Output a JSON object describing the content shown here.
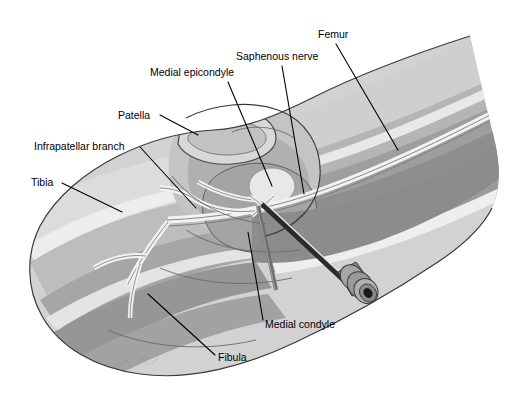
{
  "figure": {
    "background_color": "#ffffff",
    "width": 516,
    "height": 404
  },
  "palette": {
    "background": "#ffffff",
    "skin_lightest": "#e2e2e2",
    "skin_light": "#d2d2d2",
    "skin_mid": "#bdbdbd",
    "muscle_mid": "#a9a9a9",
    "muscle_dark": "#949494",
    "muscle_darkest": "#808080",
    "bone_highlight": "#eaeaea",
    "nerve_light": "#efefef",
    "outline": "#3a3a3a",
    "needle_dark": "#2b2b2b",
    "hub_gray": "#9a9a9a",
    "hub_dark": "#4a4a4a",
    "label_text": "#000000",
    "leader_line": "#000000"
  },
  "labels": [
    {
      "id": "femur",
      "text": "Femur",
      "text_x": 318,
      "text_y": 38,
      "leader": "M 336 44 L 398 150",
      "anchor": "start"
    },
    {
      "id": "saphenous-nerve",
      "text": "Saphenous nerve",
      "text_x": 236,
      "text_y": 60,
      "leader": "M 282 66 L 304 194",
      "anchor": "start"
    },
    {
      "id": "medial-epicondyle",
      "text": "Medial epicondyle",
      "text_x": 150,
      "text_y": 76,
      "leader": "M 228 82 L 272 186",
      "anchor": "start"
    },
    {
      "id": "patella",
      "text": "Patella",
      "text_x": 118,
      "text_y": 119,
      "leader": "M 160 115 L 198 135",
      "anchor": "start"
    },
    {
      "id": "infrapatellar-branch",
      "text": "Infrapatellar branch",
      "text_x": 34,
      "text_y": 150,
      "leader": "M 140 147 L 196 208",
      "anchor": "start"
    },
    {
      "id": "tibia",
      "text": "Tibia",
      "text_x": 31,
      "text_y": 186,
      "leader": "M 62 183 L 122 212",
      "anchor": "start"
    },
    {
      "id": "medial-condyle",
      "text": "Medial condyle",
      "text_x": 265,
      "text_y": 328,
      "leader": "M 263 320 L 248 232",
      "anchor": "start"
    },
    {
      "id": "fibula",
      "text": "Fibula",
      "text_x": 218,
      "text_y": 361,
      "leader": "M 215 355 L 148 294",
      "anchor": "start"
    }
  ],
  "structures": {
    "limb_silhouette": "lower limb in lateral-oblique view, knee at center",
    "femur_region": "upper right thigh with banded muscle layers",
    "tibia_region": "lower left leg with banded layers",
    "patella_outline": "rounded kneecap outline above joint",
    "medial_epicondyle": "bright oval prominence at distal femur",
    "medial_condyle": "rounded condyle below epicondyle",
    "saphenous_nerve": "light double-line band running down the limb",
    "infrapatellar_branch": "nerve branching anteriorly at the knee"
  },
  "needle": {
    "description": "hypodermic needle inserted toward the saphenous nerve",
    "tip_x": 262,
    "tip_y": 204,
    "hub_x": 355,
    "hub_y": 290,
    "shaft_color": "#2b2b2b",
    "hub_color": "#9a9a9a"
  }
}
